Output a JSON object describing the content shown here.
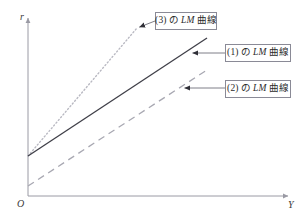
{
  "figure": {
    "background_color": "#ffffff"
  },
  "axes": {
    "vertical": {
      "label": "r",
      "name": "interest-rate-axis",
      "color": "#9a9aa4",
      "x": 28,
      "top": 18,
      "bottom": 196
    },
    "horizontal": {
      "label": "Y",
      "name": "income-axis",
      "color": "#9a9aa4",
      "y": 196,
      "left": 28,
      "right": 288
    },
    "origin": {
      "label": "O",
      "x": 28,
      "y": 196
    }
  },
  "callouts": [
    {
      "id": "3",
      "number": "(3)",
      "particle": "の",
      "curve_name": "LM",
      "suffix": "曲線",
      "full_text": "(3) の LM 曲線",
      "box": {
        "x": 155,
        "y": 12,
        "width": 62,
        "height": 18
      },
      "leader": {
        "from_x": 155,
        "from_y": 21,
        "to_x": 137,
        "to_y": 28
      }
    },
    {
      "id": "1",
      "number": "(1)",
      "particle": "の",
      "curve_name": "LM",
      "suffix": "曲線",
      "full_text": "(1) の LM 曲線",
      "box": {
        "x": 225,
        "y": 44,
        "width": 66,
        "height": 18
      },
      "leader": {
        "from_x": 225,
        "from_y": 53,
        "to_x": 190,
        "to_y": 53
      }
    },
    {
      "id": "2",
      "number": "(2)",
      "particle": "の",
      "curve_name": "LM",
      "suffix": "曲線",
      "full_text": "(2) の LM 曲線",
      "box": {
        "x": 225,
        "y": 80,
        "width": 66,
        "height": 18
      },
      "leader": {
        "from_x": 225,
        "from_y": 88,
        "to_x": 182,
        "to_y": 88
      }
    }
  ],
  "chart_data": {
    "type": "line",
    "title": "",
    "xlabel": "Y",
    "ylabel": "r",
    "grid": false,
    "legend_position": "callout-boxes",
    "xlim": [
      0,
      260
    ],
    "ylim": [
      0,
      178
    ],
    "series": [
      {
        "name": "(3) の LM 曲線",
        "label": "(3)",
        "style": "dotted",
        "color": "#b9b9c2",
        "width": 1.4,
        "x": [
          0,
          109
        ],
        "y": [
          40,
          168
        ],
        "pixel_start": [
          28,
          156
        ],
        "pixel_end": [
          137,
          28
        ],
        "slope_desc": "steepest"
      },
      {
        "name": "(1) の LM 曲線",
        "label": "(1)",
        "style": "solid",
        "color": "#3f3f48",
        "width": 1.3,
        "x": [
          0,
          179
        ],
        "y": [
          40,
          158
        ],
        "pixel_start": [
          28,
          156
        ],
        "pixel_end": [
          207,
          38
        ],
        "slope_desc": "medium"
      },
      {
        "name": "(2) の LM 曲線",
        "label": "(2)",
        "style": "dashed",
        "color": "#a8a8b2",
        "width": 1.3,
        "x": [
          0,
          179
        ],
        "y": [
          10,
          126
        ],
        "pixel_start": [
          28,
          186
        ],
        "pixel_end": [
          207,
          70
        ],
        "slope_desc": "shallowest"
      }
    ]
  }
}
